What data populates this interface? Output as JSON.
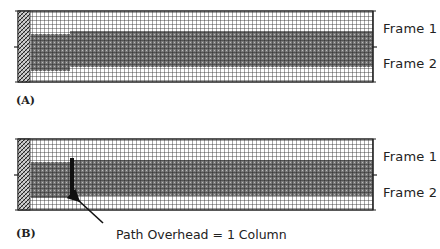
{
  "figure": {
    "panels": [
      {
        "id": "A",
        "label": "(A)",
        "frame_labels": [
          "Frame 1",
          "Frame 2"
        ],
        "annotation": null
      },
      {
        "id": "B",
        "label": "(B)",
        "frame_labels": [
          "Frame 1",
          "Frame 2"
        ],
        "annotation": "Path Overhead = 1 Column"
      }
    ],
    "colors": {
      "grid": "#333333",
      "band": "#555555",
      "overhead_column": "#111111",
      "background": "#ffffff"
    }
  }
}
